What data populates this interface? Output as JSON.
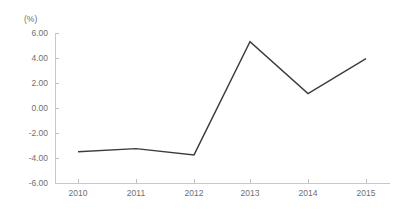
{
  "chart_data": {
    "type": "line",
    "title": "",
    "subtitle": "",
    "xlabel": "",
    "ylabel": "",
    "unit_label": "(%)",
    "categories": [
      "2010",
      "2011",
      "2012",
      "2013",
      "2014",
      "2015"
    ],
    "x": [
      2010,
      2011,
      2012,
      2013,
      2014,
      2015
    ],
    "values": [
      -3.5,
      -3.25,
      -3.75,
      5.3,
      1.15,
      3.95
    ],
    "series": [
      {
        "name": "",
        "values": [
          -3.5,
          -3.25,
          -3.75,
          5.3,
          1.15,
          3.95
        ]
      }
    ],
    "ylim": [
      -6.0,
      6.0
    ],
    "ytick_values": [
      6.0,
      4.0,
      2.0,
      0.0,
      -2.0,
      -4.0,
      -6.0
    ],
    "ytick_labels": [
      "6.00",
      "4.00",
      "2.00",
      "0.00",
      "-2.00",
      "-4.00",
      "-6.00"
    ],
    "xtick_labels": [
      "2010",
      "2011",
      "2012",
      "2013",
      "2014",
      "2015"
    ],
    "grid": false,
    "legend": false,
    "legend_position": "none",
    "annotations": [],
    "colors": {
      "line": "#3c3c3c",
      "axis": "#c8c8c8",
      "tick": "#c0c0c0",
      "text": "#6f6f6f",
      "background": "#ffffff"
    }
  },
  "layout": {
    "plot_left": 55,
    "plot_right": 390,
    "plot_top": 33,
    "plot_bottom": 183,
    "x_positions": [
      78,
      136,
      194,
      250,
      308,
      366
    ],
    "y_positions": [
      33,
      58,
      83,
      108,
      133,
      158,
      183
    ],
    "unit_label_x": 24,
    "unit_label_y": 22
  }
}
